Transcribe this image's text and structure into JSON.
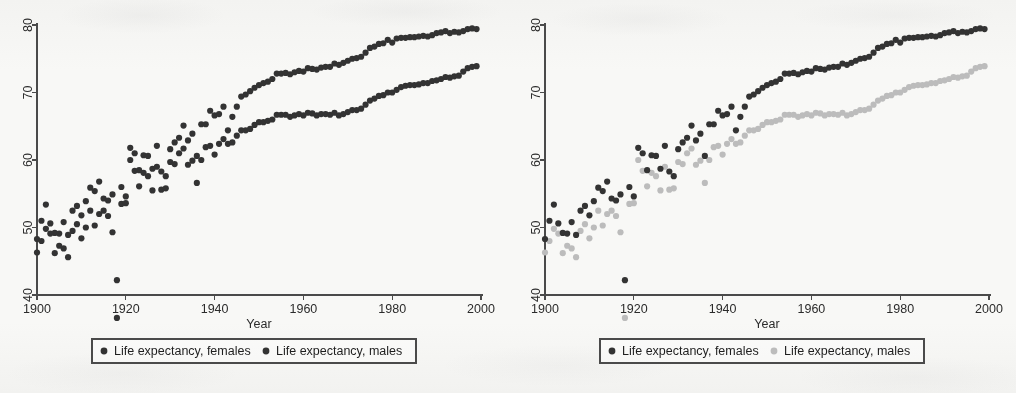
{
  "figure": {
    "caption_present": false,
    "panel_count": 2,
    "background_color": "#fbfbfa"
  },
  "colors": {
    "dark_series": "#333333",
    "light_series": "#bcbcbc",
    "axis": "#4a4a4a",
    "text": "#2b2b2b"
  },
  "chart_data": [
    {
      "panel": "left",
      "type": "scatter",
      "title": "",
      "xlabel": "Year",
      "ylabel": "",
      "xlim": [
        1898,
        2001
      ],
      "ylim": [
        35,
        82
      ],
      "xticks": [
        1900,
        1920,
        1940,
        1960,
        1980,
        2000
      ],
      "yticks": [
        40,
        50,
        60,
        70,
        80
      ],
      "xtick_labels": [
        "1900",
        "1920",
        "1940",
        "1960",
        "1980",
        "2000"
      ],
      "ytick_labels": [
        "40",
        "50",
        "60",
        "70",
        "80"
      ],
      "grid": false,
      "legend_position": "below",
      "marker_size": 3.1,
      "series": [
        {
          "name": "Life expectancy, females",
          "color": "#333333",
          "x": [
            1900,
            1901,
            1902,
            1903,
            1904,
            1905,
            1906,
            1907,
            1908,
            1909,
            1910,
            1911,
            1912,
            1913,
            1914,
            1915,
            1916,
            1917,
            1918,
            1919,
            1920,
            1921,
            1922,
            1923,
            1924,
            1925,
            1926,
            1927,
            1928,
            1929,
            1930,
            1931,
            1932,
            1933,
            1934,
            1935,
            1936,
            1937,
            1938,
            1939,
            1940,
            1941,
            1942,
            1943,
            1944,
            1945,
            1946,
            1947,
            1948,
            1949,
            1950,
            1951,
            1952,
            1953,
            1954,
            1955,
            1956,
            1957,
            1958,
            1959,
            1960,
            1961,
            1962,
            1963,
            1964,
            1965,
            1966,
            1967,
            1968,
            1969,
            1970,
            1971,
            1972,
            1973,
            1974,
            1975,
            1976,
            1977,
            1978,
            1979,
            1980,
            1981,
            1982,
            1983,
            1984,
            1985,
            1986,
            1987,
            1988,
            1989,
            1990,
            1991,
            1992,
            1993,
            1994,
            1995,
            1996,
            1997,
            1998,
            1999
          ],
          "y": [
            48.3,
            51.0,
            53.4,
            50.6,
            49.2,
            49.1,
            50.8,
            48.9,
            52.5,
            53.2,
            51.8,
            53.9,
            55.9,
            55.4,
            56.8,
            54.3,
            54.0,
            54.9,
            42.2,
            56.0,
            54.6,
            61.8,
            61.0,
            58.5,
            60.7,
            60.6,
            58.7,
            62.1,
            58.3,
            57.6,
            61.6,
            62.6,
            63.3,
            65.1,
            62.9,
            63.9,
            60.6,
            65.3,
            65.3,
            67.3,
            66.6,
            66.8,
            67.9,
            64.4,
            66.4,
            67.9,
            69.4,
            69.7,
            70.2,
            70.7,
            71.1,
            71.4,
            71.6,
            72.0,
            72.8,
            72.8,
            72.9,
            72.7,
            73.0,
            73.2,
            73.1,
            73.6,
            73.5,
            73.4,
            73.7,
            73.8,
            73.8,
            74.3,
            74.1,
            74.4,
            74.7,
            75.0,
            75.1,
            75.3,
            75.9,
            76.6,
            76.8,
            77.2,
            77.3,
            77.8,
            77.4,
            78.0,
            78.1,
            78.1,
            78.2,
            78.2,
            78.3,
            78.4,
            78.3,
            78.5,
            78.8,
            78.9,
            79.1,
            78.8,
            79.0,
            78.9,
            79.1,
            79.4,
            79.5,
            79.4
          ]
        },
        {
          "name": "Life expectancy, males",
          "color": "#333333",
          "x": [
            1900,
            1901,
            1902,
            1903,
            1904,
            1905,
            1906,
            1907,
            1908,
            1909,
            1910,
            1911,
            1912,
            1913,
            1914,
            1915,
            1916,
            1917,
            1918,
            1919,
            1920,
            1921,
            1922,
            1923,
            1924,
            1925,
            1926,
            1927,
            1928,
            1929,
            1930,
            1931,
            1932,
            1933,
            1934,
            1935,
            1936,
            1937,
            1938,
            1939,
            1940,
            1941,
            1942,
            1943,
            1944,
            1945,
            1946,
            1947,
            1948,
            1949,
            1950,
            1951,
            1952,
            1953,
            1954,
            1955,
            1956,
            1957,
            1958,
            1959,
            1960,
            1961,
            1962,
            1963,
            1964,
            1965,
            1966,
            1967,
            1968,
            1969,
            1970,
            1971,
            1972,
            1973,
            1974,
            1975,
            1976,
            1977,
            1978,
            1979,
            1980,
            1981,
            1982,
            1983,
            1984,
            1985,
            1986,
            1987,
            1988,
            1989,
            1990,
            1991,
            1992,
            1993,
            1994,
            1995,
            1996,
            1997,
            1998,
            1999
          ],
          "y": [
            46.3,
            48.0,
            49.8,
            49.1,
            46.2,
            47.3,
            46.9,
            45.6,
            49.5,
            50.5,
            48.4,
            50.0,
            52.5,
            50.3,
            52.0,
            52.5,
            51.7,
            49.3,
            36.6,
            53.5,
            53.6,
            60.0,
            58.4,
            56.1,
            58.1,
            57.6,
            55.5,
            59.0,
            55.6,
            55.8,
            59.7,
            59.4,
            61.0,
            61.7,
            59.3,
            59.9,
            56.6,
            60.0,
            61.9,
            62.1,
            60.8,
            62.4,
            63.1,
            62.4,
            62.6,
            63.6,
            64.4,
            64.4,
            64.6,
            65.2,
            65.6,
            65.6,
            65.8,
            66.0,
            66.7,
            66.7,
            66.7,
            66.4,
            66.6,
            66.8,
            66.6,
            67.0,
            66.9,
            66.6,
            66.8,
            66.8,
            66.7,
            67.0,
            66.6,
            66.8,
            67.1,
            67.4,
            67.4,
            67.6,
            68.2,
            68.8,
            69.1,
            69.5,
            69.6,
            70.0,
            70.0,
            70.4,
            70.8,
            71.0,
            71.1,
            71.1,
            71.2,
            71.4,
            71.4,
            71.7,
            71.8,
            72.0,
            72.3,
            72.2,
            72.4,
            72.5,
            73.1,
            73.6,
            73.8,
            73.9
          ]
        }
      ],
      "legend": [
        {
          "label": "Life expectancy, females",
          "color": "#333333"
        },
        {
          "label": "Life expectancy, males",
          "color": "#333333"
        }
      ]
    },
    {
      "panel": "right",
      "type": "scatter",
      "title": "",
      "xlabel": "Year",
      "ylabel": "",
      "xlim": [
        1898,
        2001
      ],
      "ylim": [
        35,
        82
      ],
      "xticks": [
        1900,
        1920,
        1940,
        1960,
        1980,
        2000
      ],
      "yticks": [
        40,
        50,
        60,
        70,
        80
      ],
      "xtick_labels": [
        "1900",
        "1920",
        "1940",
        "1960",
        "1980",
        "2000"
      ],
      "ytick_labels": [
        "40",
        "50",
        "60",
        "70",
        "80"
      ],
      "grid": false,
      "legend_position": "below",
      "marker_size": 3.1,
      "series": [
        {
          "name": "Life expectancy, females",
          "color": "#333333",
          "x": [
            1900,
            1901,
            1902,
            1903,
            1904,
            1905,
            1906,
            1907,
            1908,
            1909,
            1910,
            1911,
            1912,
            1913,
            1914,
            1915,
            1916,
            1917,
            1918,
            1919,
            1920,
            1921,
            1922,
            1923,
            1924,
            1925,
            1926,
            1927,
            1928,
            1929,
            1930,
            1931,
            1932,
            1933,
            1934,
            1935,
            1936,
            1937,
            1938,
            1939,
            1940,
            1941,
            1942,
            1943,
            1944,
            1945,
            1946,
            1947,
            1948,
            1949,
            1950,
            1951,
            1952,
            1953,
            1954,
            1955,
            1956,
            1957,
            1958,
            1959,
            1960,
            1961,
            1962,
            1963,
            1964,
            1965,
            1966,
            1967,
            1968,
            1969,
            1970,
            1971,
            1972,
            1973,
            1974,
            1975,
            1976,
            1977,
            1978,
            1979,
            1980,
            1981,
            1982,
            1983,
            1984,
            1985,
            1986,
            1987,
            1988,
            1989,
            1990,
            1991,
            1992,
            1993,
            1994,
            1995,
            1996,
            1997,
            1998,
            1999
          ],
          "y": [
            48.3,
            51.0,
            53.4,
            50.6,
            49.2,
            49.1,
            50.8,
            48.9,
            52.5,
            53.2,
            51.8,
            53.9,
            55.9,
            55.4,
            56.8,
            54.3,
            54.0,
            54.9,
            42.2,
            56.0,
            54.6,
            61.8,
            61.0,
            58.5,
            60.7,
            60.6,
            58.7,
            62.1,
            58.3,
            57.6,
            61.6,
            62.6,
            63.3,
            65.1,
            62.9,
            63.9,
            60.6,
            65.3,
            65.3,
            67.3,
            66.6,
            66.8,
            67.9,
            64.4,
            66.4,
            67.9,
            69.4,
            69.7,
            70.2,
            70.7,
            71.1,
            71.4,
            71.6,
            72.0,
            72.8,
            72.8,
            72.9,
            72.7,
            73.0,
            73.2,
            73.1,
            73.6,
            73.5,
            73.4,
            73.7,
            73.8,
            73.8,
            74.3,
            74.1,
            74.4,
            74.7,
            75.0,
            75.1,
            75.3,
            75.9,
            76.6,
            76.8,
            77.2,
            77.3,
            77.8,
            77.4,
            78.0,
            78.1,
            78.1,
            78.2,
            78.2,
            78.3,
            78.4,
            78.3,
            78.5,
            78.8,
            78.9,
            79.1,
            78.8,
            79.0,
            78.9,
            79.1,
            79.4,
            79.5,
            79.4
          ]
        },
        {
          "name": "Life expectancy, males",
          "color": "#bcbcbc",
          "x": [
            1900,
            1901,
            1902,
            1903,
            1904,
            1905,
            1906,
            1907,
            1908,
            1909,
            1910,
            1911,
            1912,
            1913,
            1914,
            1915,
            1916,
            1917,
            1918,
            1919,
            1920,
            1921,
            1922,
            1923,
            1924,
            1925,
            1926,
            1927,
            1928,
            1929,
            1930,
            1931,
            1932,
            1933,
            1934,
            1935,
            1936,
            1937,
            1938,
            1939,
            1940,
            1941,
            1942,
            1943,
            1944,
            1945,
            1946,
            1947,
            1948,
            1949,
            1950,
            1951,
            1952,
            1953,
            1954,
            1955,
            1956,
            1957,
            1958,
            1959,
            1960,
            1961,
            1962,
            1963,
            1964,
            1965,
            1966,
            1967,
            1968,
            1969,
            1970,
            1971,
            1972,
            1973,
            1974,
            1975,
            1976,
            1977,
            1978,
            1979,
            1980,
            1981,
            1982,
            1983,
            1984,
            1985,
            1986,
            1987,
            1988,
            1989,
            1990,
            1991,
            1992,
            1993,
            1994,
            1995,
            1996,
            1997,
            1998,
            1999
          ],
          "y": [
            46.3,
            48.0,
            49.8,
            49.1,
            46.2,
            47.3,
            46.9,
            45.6,
            49.5,
            50.5,
            48.4,
            50.0,
            52.5,
            50.3,
            52.0,
            52.5,
            51.7,
            49.3,
            36.6,
            53.5,
            53.6,
            60.0,
            58.4,
            56.1,
            58.1,
            57.6,
            55.5,
            59.0,
            55.6,
            55.8,
            59.7,
            59.4,
            61.0,
            61.7,
            59.3,
            59.9,
            56.6,
            60.0,
            61.9,
            62.1,
            60.8,
            62.4,
            63.1,
            62.4,
            62.6,
            63.6,
            64.4,
            64.4,
            64.6,
            65.2,
            65.6,
            65.6,
            65.8,
            66.0,
            66.7,
            66.7,
            66.7,
            66.4,
            66.6,
            66.8,
            66.6,
            67.0,
            66.9,
            66.6,
            66.8,
            66.8,
            66.7,
            67.0,
            66.6,
            66.8,
            67.1,
            67.4,
            67.4,
            67.6,
            68.2,
            68.8,
            69.1,
            69.5,
            69.6,
            70.0,
            70.0,
            70.4,
            70.8,
            71.0,
            71.1,
            71.1,
            71.2,
            71.4,
            71.4,
            71.7,
            71.8,
            72.0,
            72.3,
            72.2,
            72.4,
            72.5,
            73.1,
            73.6,
            73.8,
            73.9
          ]
        }
      ],
      "legend": [
        {
          "label": "Life expectancy, females",
          "color": "#333333"
        },
        {
          "label": "Life expectancy, males",
          "color": "#bcbcbc"
        }
      ]
    }
  ]
}
